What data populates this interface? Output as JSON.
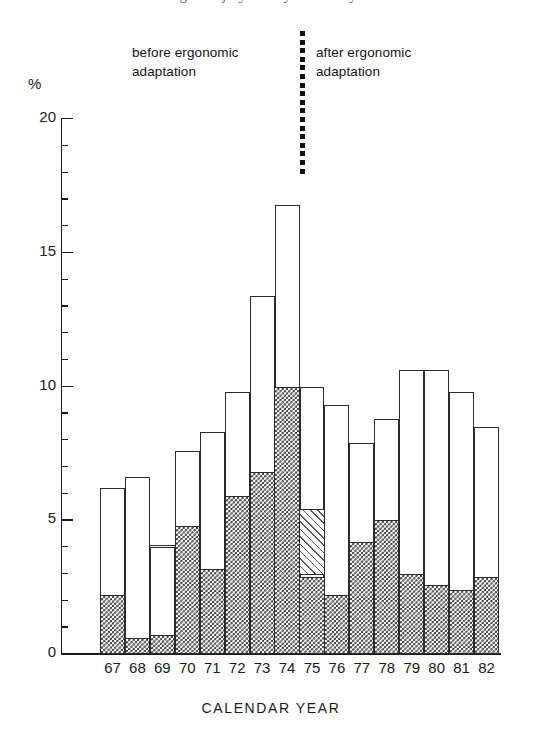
{
  "figure": {
    "clipped_top_title": "Fig. 3.  Injury rate by calendar year",
    "y_axis_unit_label": "%",
    "x_axis_title": "CALENDAR YEAR",
    "annotation_before": "before ergonomic\nadaptation",
    "annotation_after": "after ergonomic\nadaptation",
    "divider_name": "intervention-divider"
  },
  "colors": {
    "ink": "#1a1a1a",
    "bar_outline": "#2b2b2b",
    "hatch": "#3a3a3a",
    "diag_hatch": "#585858",
    "background": "#ffffff"
  },
  "chart_data": {
    "type": "bar",
    "title": "Fig. 3.  Injury rate by calendar year",
    "xlabel": "CALENDAR YEAR",
    "ylabel": "%",
    "ylim": [
      0,
      20
    ],
    "ytick_major": [
      0,
      5,
      10,
      15,
      20
    ],
    "ytick_minor_step": 1,
    "grid": false,
    "stacked": true,
    "legend_position": "none",
    "categories": [
      "67",
      "68",
      "69",
      "70",
      "71",
      "72",
      "73",
      "74",
      "75",
      "76",
      "77",
      "78",
      "79",
      "80",
      "81",
      "82"
    ],
    "series": [
      {
        "name": "cross-hatched (lower segment)",
        "fill": "cross-hatch",
        "values": [
          2.2,
          0.6,
          0.7,
          4.8,
          3.2,
          5.9,
          6.8,
          10.0,
          2.9,
          2.2,
          4.2,
          5.0,
          3.0,
          2.6,
          2.4,
          2.9
        ]
      },
      {
        "name": "diagonally hatched (middle segment)",
        "fill": "diagonal-hatch",
        "values": [
          0,
          0,
          0,
          0,
          0,
          0,
          0,
          0,
          2.5,
          0,
          0,
          0,
          0,
          0,
          0,
          0
        ]
      },
      {
        "name": "open / unfilled (upper segment)",
        "fill": "open",
        "values": [
          4.0,
          6.0,
          3.3,
          2.8,
          5.1,
          3.9,
          6.6,
          6.8,
          4.6,
          7.1,
          3.7,
          3.8,
          7.6,
          8.0,
          7.4,
          5.6
        ]
      }
    ],
    "totals": [
      6.2,
      6.6,
      4.0,
      7.6,
      8.3,
      9.8,
      13.4,
      16.8,
      10.0,
      9.3,
      7.9,
      8.8,
      10.6,
      10.6,
      9.8,
      8.5
    ],
    "internal_rules": [
      {
        "category": "69",
        "value": 4.0,
        "note": "horizontal rule inside open bar at 4.0"
      }
    ],
    "annotations": [
      {
        "text": "before ergonomic adaptation",
        "x_span": [
          "67",
          "74"
        ]
      },
      {
        "text": "after ergonomic adaptation",
        "x_span": [
          "75",
          "82"
        ]
      },
      {
        "type": "vertical-dotted-line",
        "between": [
          "74",
          "75"
        ]
      }
    ]
  }
}
